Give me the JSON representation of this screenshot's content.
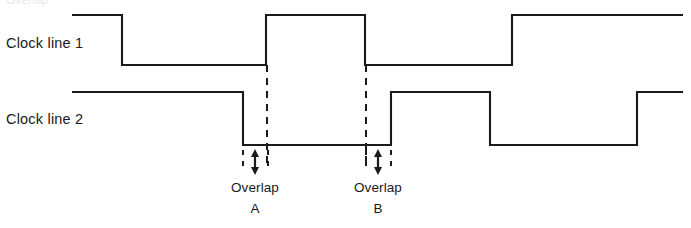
{
  "figure": {
    "title_partial": "Overlap",
    "background_color": "#ffffff",
    "stroke_color": "#1a1a1a",
    "width": 691,
    "height": 228
  },
  "waveforms": [
    {
      "name": "clock-line-1",
      "label": "Clock line 1",
      "high_y": 15,
      "low_y": 65,
      "x_start": 72,
      "x_end": 683,
      "initial_level": "high",
      "transitions": [
        {
          "x": 122,
          "to": "low"
        },
        {
          "x": 266,
          "to": "high"
        },
        {
          "x": 365,
          "to": "low"
        },
        {
          "x": 512,
          "to": "high"
        }
      ]
    },
    {
      "name": "clock-line-2",
      "label": "Clock line 2",
      "high_y": 92,
      "low_y": 145,
      "x_start": 72,
      "x_end": 683,
      "initial_level": "high",
      "transitions": [
        {
          "x": 243,
          "to": "low"
        },
        {
          "x": 391,
          "to": "high"
        },
        {
          "x": 490,
          "to": "low"
        },
        {
          "x": 637,
          "to": "high"
        }
      ]
    }
  ],
  "guide_lines": [
    {
      "name": "guide-line-overlap-a",
      "x": 267,
      "y_top": 65,
      "y_bottom": 165,
      "style": "dashed"
    },
    {
      "name": "guide-line-overlap-b",
      "x": 366,
      "y_top": 65,
      "y_bottom": 165,
      "style": "dashed"
    }
  ],
  "overlap_markers": [
    {
      "name": "overlap-a",
      "label": "Overlap",
      "identifier": "A",
      "left_tick_x": 243,
      "right_tick_x": 268,
      "arrow_x": 255,
      "arrow_top_y": 152,
      "arrow_bottom_y": 172,
      "tick_top_y": 150,
      "tick_bottom_y": 172
    },
    {
      "name": "overlap-b",
      "label": "Overlap",
      "identifier": "B",
      "left_tick_x": 366,
      "right_tick_x": 391,
      "arrow_x": 378,
      "arrow_top_y": 152,
      "arrow_bottom_y": 172,
      "tick_top_y": 150,
      "tick_bottom_y": 172
    }
  ],
  "chart_data": {
    "type": "line",
    "xlabel": "",
    "ylabel": "",
    "grid": false,
    "legend_position": "left",
    "x_range": [
      72,
      683
    ],
    "series": [
      {
        "name": "Clock line 1",
        "levels": [
          "high",
          "low",
          "high",
          "low",
          "high"
        ],
        "edge_x": [
          72,
          122,
          266,
          365,
          512,
          683
        ],
        "high_y": 15,
        "low_y": 65
      },
      {
        "name": "Clock line 2",
        "levels": [
          "high",
          "low",
          "high",
          "low",
          "high"
        ],
        "edge_x": [
          72,
          243,
          391,
          490,
          637,
          683
        ],
        "high_y": 92,
        "low_y": 145
      }
    ],
    "annotations": [
      {
        "text": "Overlap A",
        "x_span": [
          243,
          268
        ],
        "y": 160
      },
      {
        "text": "Overlap B",
        "x_span": [
          366,
          391
        ],
        "y": 160
      }
    ]
  }
}
